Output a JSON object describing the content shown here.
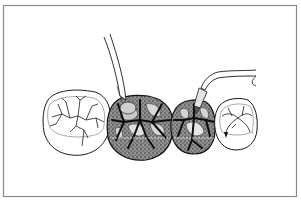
{
  "figure": {
    "colors": {
      "background": "#ffffff",
      "frame": "#8a8a8a",
      "ink": "#1a1a1a",
      "stipple": "#5a5a5a",
      "fissure_dark": "#0d0d0d"
    },
    "teeth": [
      {
        "id": "tooth-1",
        "style": "outline-with-fissures"
      },
      {
        "id": "tooth-2",
        "style": "stippled-dark"
      },
      {
        "id": "tooth-3",
        "style": "stippled-dark"
      },
      {
        "id": "tooth-4",
        "style": "outline-with-fissures"
      }
    ],
    "instruments": [
      {
        "id": "explorer",
        "type": "explorer-probe"
      },
      {
        "id": "handpiece",
        "type": "angled-handpiece-tip"
      }
    ]
  }
}
